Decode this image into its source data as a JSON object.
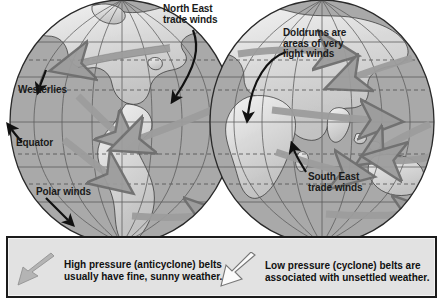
{
  "figure": {
    "globes": [
      {
        "name": "western-hemisphere",
        "cx": 122,
        "cy": 122,
        "rx": 112,
        "ry": 122
      },
      {
        "name": "eastern-hemisphere",
        "cx": 322,
        "cy": 122,
        "rx": 112,
        "ry": 122
      }
    ]
  },
  "annotations": [
    {
      "id": "north-east-trade-winds",
      "text": "North East\ntrade winds",
      "x": 163,
      "y": 6,
      "size": "md"
    },
    {
      "id": "doldrums",
      "text": "Doldrums are\nareas of very\nlight winds",
      "x": 283,
      "y": 30,
      "size": "md"
    },
    {
      "id": "westerlies",
      "text": "Westerlies",
      "x": 20,
      "y": 86,
      "size": "md"
    },
    {
      "id": "equator",
      "text": "Equator",
      "x": 16,
      "y": 138,
      "size": "md"
    },
    {
      "id": "polar-winds",
      "text": "Polar winds",
      "x": 36,
      "y": 188,
      "size": "md"
    },
    {
      "id": "south-east-trade-winds",
      "text": "South East\ntrade winds",
      "x": 308,
      "y": 174,
      "size": "md"
    }
  ],
  "legend": {
    "items": [
      {
        "id": "high-pressure",
        "arrow_style": "filled",
        "arrow_color": "#b4b4b4",
        "text": "High pressure (anticyclone) belts\nusually have fine, sunny weather."
      },
      {
        "id": "low-pressure",
        "arrow_style": "outline",
        "arrow_color": "#ffffff",
        "text": "Low pressure (cyclone) belts are\nassociated with unsettled weather."
      }
    ]
  },
  "colors": {
    "ocean": "#a9a9a9",
    "land": "#d9d9d9",
    "land_light": "#efefef",
    "graticule": "#5a5a5a",
    "outline": "#2a2a2a",
    "wind_arrow": "#9c9c9c",
    "wind_arrow_edge": "#6e6e6e",
    "pointer_arrow": "#111111",
    "legend_bg": "#e2e2e2",
    "legend_border": "#1b1b1b",
    "page_bg": "#ffffff"
  }
}
